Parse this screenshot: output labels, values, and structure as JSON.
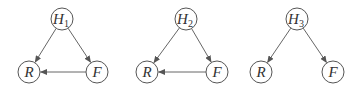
{
  "diagram": {
    "type": "directed-graphs",
    "colors": {
      "stroke": "#555555",
      "text": "#333333",
      "background": "#ffffff"
    },
    "graphs": [
      {
        "id": "graph-1",
        "nodes": [
          {
            "id": "H1",
            "label": "H",
            "subscript": "1",
            "x": 62,
            "y": 19
          },
          {
            "id": "R",
            "label": "R",
            "subscript": "",
            "x": 29,
            "y": 72
          },
          {
            "id": "F",
            "label": "F",
            "subscript": "",
            "x": 97,
            "y": 72
          }
        ],
        "edges": [
          {
            "from": "H1",
            "to": "R"
          },
          {
            "from": "H1",
            "to": "F"
          },
          {
            "from": "F",
            "to": "R"
          }
        ]
      },
      {
        "id": "graph-2",
        "nodes": [
          {
            "id": "H2",
            "label": "H",
            "subscript": "2",
            "x": 186,
            "y": 19
          },
          {
            "id": "R",
            "label": "R",
            "subscript": "",
            "x": 147,
            "y": 72
          },
          {
            "id": "F",
            "label": "F",
            "subscript": "",
            "x": 217,
            "y": 72
          }
        ],
        "edges": [
          {
            "from": "H2",
            "to": "R"
          },
          {
            "from": "H2",
            "to": "F"
          },
          {
            "from": "F",
            "to": "R"
          }
        ]
      },
      {
        "id": "graph-3",
        "nodes": [
          {
            "id": "H3",
            "label": "H",
            "subscript": "3",
            "x": 297,
            "y": 19
          },
          {
            "id": "R",
            "label": "R",
            "subscript": "",
            "x": 261,
            "y": 72
          },
          {
            "id": "F",
            "label": "F",
            "subscript": "",
            "x": 333,
            "y": 72
          }
        ],
        "edges": [
          {
            "from": "H3",
            "to": "R"
          },
          {
            "from": "H3",
            "to": "F"
          }
        ]
      }
    ]
  }
}
